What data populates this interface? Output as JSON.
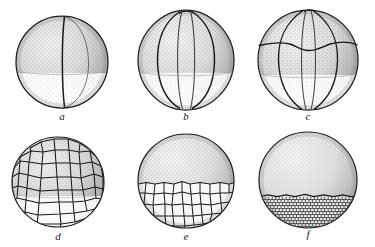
{
  "plate": {
    "title": "Cleavage stages of an amphibian egg",
    "background_color": "#ffffff",
    "ink_color": "#1a1a1a",
    "animal_pole_shade": "#9a9a9a",
    "vegetal_pole_shade": "#e8e8e8",
    "width": 375,
    "height": 247
  },
  "panels": [
    {
      "id": "a",
      "label": "a",
      "stage_name": "two-cell stage",
      "cell_count": 2,
      "furrows": "one vertical meridional cleavage furrow",
      "cx": 62,
      "cy": 62,
      "rx": 46,
      "ry": 46,
      "equator_y": 0.68,
      "label_x": 42,
      "label_y": 112
    },
    {
      "id": "b",
      "label": "b",
      "stage_name": "four-cell stage",
      "cell_count": 4,
      "furrows": "two vertical meridional cleavage furrows",
      "cx": 186,
      "cy": 60,
      "rx": 48,
      "ry": 50,
      "equator_y": 0.66,
      "label_x": 166,
      "label_y": 112
    },
    {
      "id": "c",
      "label": "c",
      "stage_name": "eight-cell stage",
      "cell_count": 8,
      "furrows": "meridional furrows plus one latitudinal (equatorial) furrow",
      "cx": 308,
      "cy": 60,
      "rx": 50,
      "ry": 50,
      "equator_y": 0.7,
      "latitudinal_y": 0.3,
      "label_x": 288,
      "label_y": 112
    },
    {
      "id": "d",
      "label": "d",
      "stage_name": "morula",
      "cell_count": 64,
      "furrows": "many polygonal blastomeres over the whole surface",
      "cx": 62,
      "cy": 182,
      "rx": 46,
      "ry": 45,
      "equator_y": 0.64,
      "label_x": 42,
      "label_y": 232
    },
    {
      "id": "e",
      "label": "e",
      "stage_name": "blastula, large vegetal blastomeres",
      "cell_count": 90,
      "furrows": "coarse polygonal cells below the equator, stippled animal cap above",
      "cx": 186,
      "cy": 182,
      "rx": 48,
      "ry": 47,
      "equator_y": 0.48,
      "label_x": 166,
      "label_y": 232
    },
    {
      "id": "f",
      "label": "f",
      "stage_name": "late blastula, fine vegetal blastomeres",
      "cell_count": 200,
      "furrows": "fine polygonal cells in the lower third, smooth stippled animal cap",
      "cx": 308,
      "cy": 180,
      "rx": 49,
      "ry": 48,
      "equator_y": 0.62,
      "label_x": 288,
      "label_y": 230
    }
  ]
}
